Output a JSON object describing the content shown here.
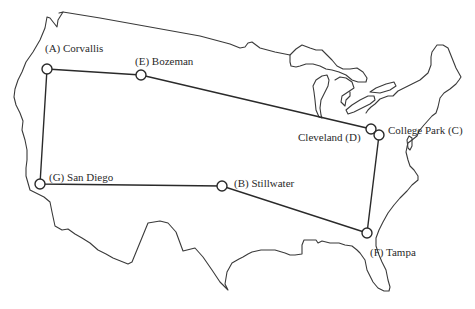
{
  "map": {
    "title": "",
    "region": "continental-united-states-outline",
    "colors": {
      "outline": "#3a3a3a",
      "route": "#2a2a2a",
      "node_fill": "#ffffff",
      "background": "#ffffff"
    },
    "nodes": [
      {
        "id": "A",
        "name": "Corvallis",
        "label": "(A) Corvallis",
        "x": 47,
        "y": 69,
        "label_x": 45,
        "label_y": 52
      },
      {
        "id": "E",
        "name": "Bozeman",
        "label": "(E) Bozeman",
        "x": 141,
        "y": 75,
        "label_x": 135,
        "label_y": 65
      },
      {
        "id": "D",
        "name": "Cleveland",
        "label": "Cleveland (D)",
        "x": 371,
        "y": 129,
        "label_x": 298,
        "label_y": 140
      },
      {
        "id": "C",
        "name": "College Park",
        "label": "College Park (C)",
        "x": 379,
        "y": 135,
        "label_x": 388,
        "label_y": 133
      },
      {
        "id": "G",
        "name": "San Diego",
        "label": "(G) San Diego",
        "x": 40,
        "y": 184,
        "label_x": 48,
        "label_y": 180
      },
      {
        "id": "B",
        "name": "Stillwater",
        "label": "(B) Stillwater",
        "x": 222,
        "y": 186,
        "label_x": 234,
        "label_y": 186
      },
      {
        "id": "F",
        "name": "Tampa",
        "label": "(F) Tampa",
        "x": 367,
        "y": 233,
        "label_x": 370,
        "label_y": 255
      }
    ],
    "route": [
      "A",
      "E",
      "D",
      "C",
      "F",
      "B",
      "G",
      "A"
    ]
  }
}
